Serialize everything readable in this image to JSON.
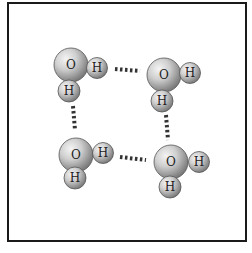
{
  "diagram": {
    "title": "",
    "colors": {
      "atom_fill": "#c8c8c8",
      "atom_shadow": "#7a7a7a",
      "bond": "#333333",
      "border": "#1a1a1a"
    },
    "molecules": [
      {
        "id": "m1",
        "o": {
          "label": "O",
          "x": 71,
          "y": 65
        },
        "h1": {
          "label": "H",
          "x": 97,
          "y": 68
        },
        "h2": {
          "label": "H",
          "x": 69,
          "y": 91
        }
      },
      {
        "id": "m2",
        "o": {
          "label": "O",
          "x": 164,
          "y": 75
        },
        "h1": {
          "label": "H",
          "x": 190,
          "y": 73
        },
        "h2": {
          "label": "H",
          "x": 162,
          "y": 101
        }
      },
      {
        "id": "m3",
        "o": {
          "label": "O",
          "x": 76,
          "y": 155
        },
        "h1": {
          "label": "H",
          "x": 103,
          "y": 153
        },
        "h2": {
          "label": "H",
          "x": 75,
          "y": 178
        }
      },
      {
        "id": "m4",
        "o": {
          "label": "O",
          "x": 171,
          "y": 162
        },
        "h1": {
          "label": "H",
          "x": 199,
          "y": 162
        },
        "h2": {
          "label": "H",
          "x": 170,
          "y": 187
        }
      }
    ],
    "hydrogen_bonds": [
      {
        "from": "m1.h1",
        "to": "m2.o",
        "x1": 115,
        "y1": 69,
        "x2": 140,
        "y2": 71
      },
      {
        "from": "m1.h2",
        "to": "m3.o",
        "x1": 73,
        "y1": 106,
        "x2": 75,
        "y2": 130
      },
      {
        "from": "m2.h2",
        "to": "m4.o",
        "x1": 166,
        "y1": 115,
        "x2": 168,
        "y2": 140
      },
      {
        "from": "m3.h1",
        "to": "m4.o",
        "x1": 120,
        "y1": 157,
        "x2": 146,
        "y2": 160
      }
    ]
  }
}
